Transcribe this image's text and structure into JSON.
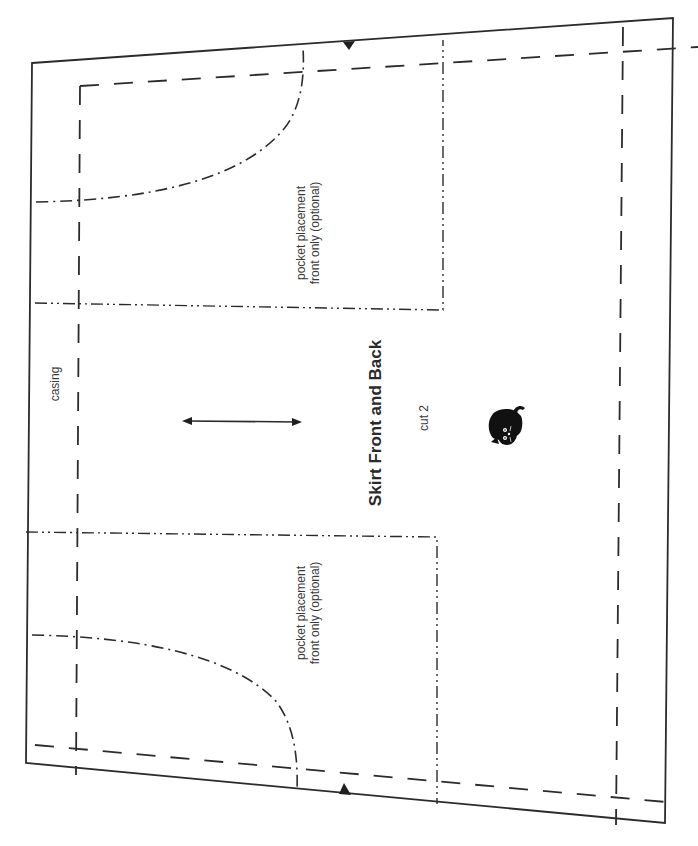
{
  "pattern": {
    "piece_title": "Skirt Front and Back",
    "cut_instruction": "cut 2",
    "casing_label": "casing",
    "pockets": [
      {
        "line1": "pocket placement",
        "line2": "front only (optional)"
      },
      {
        "line1": "pocket placement",
        "line2": "front only (optional)"
      }
    ],
    "grainline": "double-arrow-grainline",
    "notches": [
      "top-notch",
      "bottom-notch"
    ],
    "logo_icon": "black-cat-icon",
    "colors": {
      "line": "#2b2b2b",
      "background": "#ffffff",
      "text": "#3a3a3a"
    }
  }
}
